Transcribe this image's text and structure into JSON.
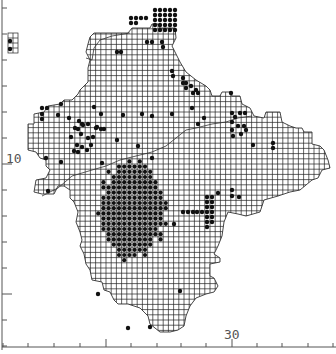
{
  "map": {
    "width": 336,
    "height": 354,
    "colors": {
      "background": "#ffffff",
      "grid": "#222222",
      "dot": "#111111",
      "axis": "#555555",
      "boundary": "#333333"
    },
    "cell_size": 5.2,
    "grid_origin": {
      "x": 2,
      "y": 8
    },
    "axis_labels": {
      "y_label": "10",
      "x_label": "30"
    },
    "y_label_pos": {
      "x": 6,
      "y": 152
    },
    "x_label_pos": {
      "x": 224,
      "y": 328
    },
    "y_ticks": [
      8,
      34,
      60,
      86,
      112,
      138,
      164,
      190,
      216,
      242,
      268,
      294,
      320,
      346
    ],
    "x_ticks": [
      3,
      28,
      54,
      80,
      106,
      131,
      157,
      181,
      206,
      232,
      257,
      282,
      308,
      333
    ],
    "region_outline": [
      [
        90,
        37
      ],
      [
        94,
        33
      ],
      [
        110,
        33
      ],
      [
        128,
        33
      ],
      [
        132,
        28
      ],
      [
        150,
        28
      ],
      [
        152,
        24
      ],
      [
        158,
        24
      ],
      [
        160,
        28
      ],
      [
        163,
        28
      ],
      [
        175,
        28
      ],
      [
        176,
        38
      ],
      [
        172,
        46
      ],
      [
        176,
        54
      ],
      [
        180,
        62
      ],
      [
        186,
        72
      ],
      [
        196,
        80
      ],
      [
        206,
        86
      ],
      [
        210,
        90
      ],
      [
        212,
        96
      ],
      [
        220,
        96
      ],
      [
        222,
        92
      ],
      [
        230,
        92
      ],
      [
        232,
        96
      ],
      [
        240,
        96
      ],
      [
        242,
        104
      ],
      [
        250,
        108
      ],
      [
        254,
        116
      ],
      [
        264,
        118
      ],
      [
        266,
        112
      ],
      [
        280,
        112
      ],
      [
        282,
        122
      ],
      [
        290,
        126
      ],
      [
        296,
        128
      ],
      [
        302,
        128
      ],
      [
        304,
        132
      ],
      [
        312,
        132
      ],
      [
        312,
        144
      ],
      [
        320,
        146
      ],
      [
        324,
        150
      ],
      [
        328,
        160
      ],
      [
        330,
        168
      ],
      [
        322,
        170
      ],
      [
        318,
        178
      ],
      [
        312,
        180
      ],
      [
        300,
        190
      ],
      [
        290,
        192
      ],
      [
        278,
        196
      ],
      [
        264,
        200
      ],
      [
        260,
        212
      ],
      [
        246,
        216
      ],
      [
        238,
        214
      ],
      [
        228,
        212
      ],
      [
        224,
        222
      ],
      [
        222,
        236
      ],
      [
        218,
        246
      ],
      [
        214,
        254
      ],
      [
        220,
        258
      ],
      [
        220,
        262
      ],
      [
        210,
        264
      ],
      [
        210,
        276
      ],
      [
        214,
        278
      ],
      [
        218,
        286
      ],
      [
        214,
        292
      ],
      [
        206,
        294
      ],
      [
        196,
        298
      ],
      [
        190,
        306
      ],
      [
        186,
        316
      ],
      [
        184,
        326
      ],
      [
        178,
        330
      ],
      [
        170,
        332
      ],
      [
        160,
        332
      ],
      [
        150,
        324
      ],
      [
        148,
        316
      ],
      [
        140,
        308
      ],
      [
        128,
        304
      ],
      [
        118,
        304
      ],
      [
        114,
        300
      ],
      [
        110,
        292
      ],
      [
        104,
        290
      ],
      [
        102,
        282
      ],
      [
        92,
        280
      ],
      [
        90,
        270
      ],
      [
        86,
        264
      ],
      [
        84,
        254
      ],
      [
        80,
        246
      ],
      [
        82,
        240
      ],
      [
        80,
        232
      ],
      [
        76,
        222
      ],
      [
        78,
        212
      ],
      [
        74,
        202
      ],
      [
        70,
        198
      ],
      [
        70,
        190
      ],
      [
        64,
        186
      ],
      [
        58,
        186
      ],
      [
        54,
        194
      ],
      [
        42,
        194
      ],
      [
        34,
        192
      ],
      [
        36,
        180
      ],
      [
        46,
        178
      ],
      [
        50,
        170
      ],
      [
        46,
        166
      ],
      [
        46,
        160
      ],
      [
        40,
        158
      ],
      [
        36,
        152
      ],
      [
        28,
        150
      ],
      [
        28,
        124
      ],
      [
        34,
        124
      ],
      [
        34,
        114
      ],
      [
        44,
        112
      ],
      [
        48,
        106
      ],
      [
        60,
        104
      ],
      [
        64,
        100
      ],
      [
        72,
        100
      ],
      [
        78,
        94
      ],
      [
        80,
        90
      ],
      [
        88,
        82
      ],
      [
        88,
        68
      ],
      [
        90,
        60
      ],
      [
        86,
        52
      ],
      [
        88,
        44
      ]
    ],
    "inset_box": {
      "x": 8,
      "y": 33,
      "w": 10,
      "h": 20
    },
    "inner_boundary": [
      [
        86,
        58
      ],
      [
        92,
        60
      ],
      [
        94,
        48
      ],
      [
        100,
        40
      ],
      [
        112,
        36
      ],
      [
        130,
        33
      ]
    ],
    "river_line": [
      [
        42,
        196
      ],
      [
        58,
        188
      ],
      [
        72,
        176
      ],
      [
        92,
        170
      ],
      [
        106,
        166
      ],
      [
        120,
        160
      ],
      [
        136,
        156
      ],
      [
        152,
        152
      ],
      [
        166,
        146
      ],
      [
        176,
        138
      ],
      [
        186,
        130
      ],
      [
        196,
        128
      ],
      [
        212,
        124
      ],
      [
        226,
        122
      ],
      [
        238,
        118
      ],
      [
        252,
        116
      ]
    ],
    "dense_clusters": [
      {
        "name": "south-central",
        "x0": 97,
        "y0": 156,
        "x1": 168,
        "y1": 262
      }
    ],
    "dots": [
      [
        10,
        41
      ],
      [
        10,
        49
      ],
      [
        131,
        18
      ],
      [
        136,
        18
      ],
      [
        141,
        18
      ],
      [
        146,
        18
      ],
      [
        131,
        23
      ],
      [
        136,
        23
      ],
      [
        155,
        10
      ],
      [
        160,
        10
      ],
      [
        165,
        10
      ],
      [
        170,
        10
      ],
      [
        175,
        10
      ],
      [
        155,
        15
      ],
      [
        160,
        15
      ],
      [
        165,
        15
      ],
      [
        170,
        15
      ],
      [
        175,
        15
      ],
      [
        155,
        20
      ],
      [
        160,
        20
      ],
      [
        165,
        20
      ],
      [
        170,
        20
      ],
      [
        175,
        20
      ],
      [
        155,
        25
      ],
      [
        160,
        25
      ],
      [
        165,
        25
      ],
      [
        170,
        25
      ],
      [
        175,
        25
      ],
      [
        155,
        30
      ],
      [
        160,
        30
      ],
      [
        165,
        30
      ],
      [
        170,
        30
      ],
      [
        175,
        30
      ],
      [
        147,
        42
      ],
      [
        152,
        42
      ],
      [
        162,
        42
      ],
      [
        163,
        47
      ],
      [
        117,
        52
      ],
      [
        121,
        52
      ],
      [
        172,
        71
      ],
      [
        173,
        76
      ],
      [
        183,
        78
      ],
      [
        183,
        83
      ],
      [
        186,
        83
      ],
      [
        191,
        86
      ],
      [
        186,
        88
      ],
      [
        196,
        90
      ],
      [
        193,
        93
      ],
      [
        198,
        93
      ],
      [
        192,
        108
      ],
      [
        172,
        114
      ],
      [
        198,
        124
      ],
      [
        204,
        118
      ],
      [
        232,
        113
      ],
      [
        235,
        117
      ],
      [
        240,
        113
      ],
      [
        245,
        113
      ],
      [
        232,
        122
      ],
      [
        238,
        126
      ],
      [
        244,
        126
      ],
      [
        232,
        130
      ],
      [
        241,
        134
      ],
      [
        246,
        130
      ],
      [
        233,
        136
      ],
      [
        253,
        145
      ],
      [
        273,
        143
      ],
      [
        273,
        148
      ],
      [
        231,
        93
      ],
      [
        42,
        108
      ],
      [
        47,
        108
      ],
      [
        42,
        114
      ],
      [
        42,
        119
      ],
      [
        61,
        104
      ],
      [
        58,
        115
      ],
      [
        69,
        118
      ],
      [
        79,
        121
      ],
      [
        82,
        124
      ],
      [
        78,
        129
      ],
      [
        83,
        125
      ],
      [
        88,
        124
      ],
      [
        75,
        128
      ],
      [
        81,
        134
      ],
      [
        93,
        137
      ],
      [
        97,
        127
      ],
      [
        88,
        138
      ],
      [
        91,
        145
      ],
      [
        87,
        150
      ],
      [
        96,
        128
      ],
      [
        71,
        137
      ],
      [
        77,
        145
      ],
      [
        78,
        152
      ],
      [
        82,
        147
      ],
      [
        74,
        151
      ],
      [
        101,
        129
      ],
      [
        104,
        129
      ],
      [
        61,
        162
      ],
      [
        46,
        158
      ],
      [
        142,
        114
      ],
      [
        152,
        116
      ],
      [
        123,
        115
      ],
      [
        138,
        146
      ],
      [
        117,
        140
      ],
      [
        102,
        163
      ],
      [
        152,
        158
      ],
      [
        48,
        191
      ],
      [
        128,
        328
      ],
      [
        101,
        114
      ],
      [
        94,
        107
      ]
    ],
    "extra_dots_southeast": [
      [
        207,
        197
      ],
      [
        212,
        197
      ],
      [
        207,
        202
      ],
      [
        212,
        202
      ],
      [
        207,
        207
      ],
      [
        212,
        207
      ],
      [
        207,
        212
      ],
      [
        212,
        212
      ],
      [
        202,
        212
      ],
      [
        207,
        217
      ],
      [
        212,
        217
      ],
      [
        207,
        222
      ],
      [
        212,
        222
      ],
      [
        207,
        227
      ],
      [
        197,
        212
      ],
      [
        193,
        212
      ],
      [
        188,
        212
      ],
      [
        183,
        212
      ],
      [
        174,
        224
      ],
      [
        232,
        190
      ],
      [
        232,
        196
      ],
      [
        239,
        197
      ],
      [
        218,
        193
      ],
      [
        180,
        291
      ],
      [
        150,
        327
      ],
      [
        98,
        294
      ]
    ]
  }
}
